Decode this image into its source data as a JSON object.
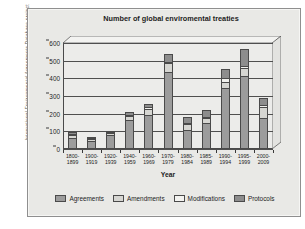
{
  "figure": {
    "source_credit": "International Environmental Agreements Database project (www.iea.uoregon.edu)."
  },
  "chart_data": {
    "type": "bar",
    "stacked": true,
    "title": "Number of global enviromental treaties",
    "xlabel": "Year",
    "ylabel": "",
    "ylim": [
      0,
      600
    ],
    "yticks": [
      0,
      100,
      200,
      300,
      400,
      500,
      600
    ],
    "grid": true,
    "legend_position": "bottom",
    "categories": [
      "1800-\n1899",
      "1900-\n1919",
      "1920-\n1939",
      "1940-\n1959",
      "1960-\n1969",
      "1970-\n1979",
      "1980-\n1984",
      "1985-\n1989",
      "1990-\n1994",
      "1995-\n1999",
      "2000-\n2009"
    ],
    "series": [
      {
        "name": "Agreements",
        "color": "#9c9c9c",
        "values": [
          65,
          48,
          80,
          165,
          195,
          435,
          110,
          145,
          345,
          415,
          175
        ]
      },
      {
        "name": "Amendments",
        "color": "#d6d6d2",
        "values": [
          15,
          4,
          10,
          22,
          32,
          52,
          30,
          28,
          35,
          45,
          65
        ]
      },
      {
        "name": "Modifications",
        "color": "#f1f1ee",
        "values": [
          5,
          2,
          5,
          6,
          10,
          8,
          8,
          9,
          20,
          10,
          5
        ]
      },
      {
        "name": "Protocols",
        "color": "#8d8d8d",
        "values": [
          12,
          2,
          5,
          15,
          20,
          45,
          35,
          38,
          55,
          95,
          45
        ]
      }
    ],
    "totals": [
      97,
      56,
      100,
      208,
      257,
      540,
      183,
      220,
      455,
      565,
      290
    ]
  }
}
